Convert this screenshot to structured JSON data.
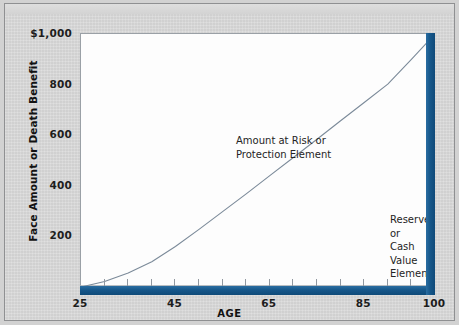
{
  "figure": {
    "background_color": "#d2d2d2",
    "plot_background_color": "#fdfdfd",
    "accent_color": "#1b5a8c",
    "curve_color": "#7b8a99"
  },
  "chart_data": {
    "type": "line",
    "title": "",
    "subtitle": "",
    "xlabel": "AGE",
    "ylabel": "Face Amount or Death Benefit",
    "xlim": [
      25,
      100
    ],
    "ylim": [
      0,
      1000
    ],
    "grid": false,
    "legend_position": "none",
    "x_tick_labels": [
      "25",
      "45",
      "65",
      "85",
      "100"
    ],
    "x_tick_values": [
      25,
      45,
      65,
      85,
      100
    ],
    "x_minor_tick_values": [
      30,
      35,
      40,
      45,
      50,
      55,
      60,
      65,
      70,
      75,
      80,
      85,
      90,
      95
    ],
    "y_tick_labels": [
      "$1,000",
      "800",
      "600",
      "400",
      "200"
    ],
    "y_tick_values": [
      1000,
      800,
      600,
      400,
      200
    ],
    "series": [
      {
        "name": "Cash Value / Reserve",
        "x": [
          25,
          30,
          35,
          40,
          45,
          50,
          55,
          60,
          65,
          70,
          75,
          80,
          85,
          90,
          95,
          100
        ],
        "values": [
          0,
          22,
          55,
          100,
          160,
          228,
          298,
          368,
          440,
          512,
          584,
          657,
          729,
          802,
          900,
          1000
        ]
      }
    ],
    "annotations": [
      {
        "id": "amount-at-risk",
        "text": "Amount at Risk or\nProtection Element",
        "x": 42,
        "y": 740
      },
      {
        "id": "reserve-cash-value",
        "text": "Reserve or\nCash Value\nElement",
        "x": 73,
        "y": 425
      }
    ]
  },
  "axes": {
    "y_title": "Face Amount or Death Benefit",
    "x_title": "AGE",
    "y_ticks": [
      {
        "label": "$1,000",
        "value": 1000
      },
      {
        "label": "800",
        "value": 800
      },
      {
        "label": "600",
        "value": 600
      },
      {
        "label": "400",
        "value": 400
      },
      {
        "label": "200",
        "value": 200
      }
    ],
    "x_ticks": [
      {
        "label": "25",
        "value": 25
      },
      {
        "label": "45",
        "value": 45
      },
      {
        "label": "65",
        "value": 65
      },
      {
        "label": "85",
        "value": 85
      },
      {
        "label": "100",
        "value": 100
      }
    ]
  },
  "annotations": {
    "risk": {
      "line1": "Amount at Risk or",
      "line2": "Protection Element"
    },
    "reserve": {
      "line1": "Reserve or",
      "line2": "Cash Value",
      "line3": "Element"
    }
  }
}
